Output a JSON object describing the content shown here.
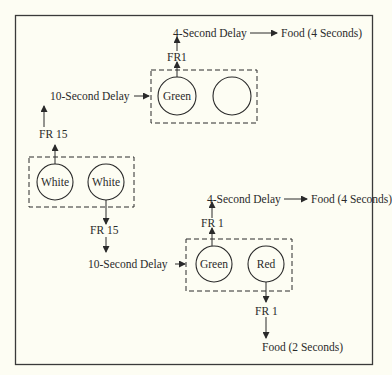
{
  "diagram": {
    "frame": {
      "x": 15,
      "y": 15,
      "width": 357,
      "height": 349
    },
    "colors": {
      "background": "#fdfdf3",
      "ink": "#2a2a2a"
    },
    "stages": [
      {
        "id": "initial-link",
        "keys": [
          {
            "label": "White"
          },
          {
            "label": "White"
          }
        ],
        "outputs": [
          {
            "schedule": "FR 15",
            "leads_to": "10-Second Delay",
            "then": "top-link"
          },
          {
            "schedule": "FR 15",
            "leads_to": "10-Second Delay",
            "then": "bottom-link"
          }
        ]
      },
      {
        "id": "top-link",
        "entry_label": "10-Second Delay",
        "keys": [
          {
            "label": "Green"
          },
          {
            "label": ""
          }
        ],
        "schedule": "FR1",
        "delay": "4-Second Delay",
        "outcome": "Food (4 Seconds)"
      },
      {
        "id": "bottom-link",
        "entry_label": "10-Second Delay",
        "keys": [
          {
            "label": "Green"
          },
          {
            "label": "Red"
          }
        ],
        "green_path": {
          "schedule": "FR 1",
          "delay": "4-Second Delay",
          "outcome": "Food (4 Seconds)"
        },
        "red_path": {
          "schedule": "FR 1",
          "outcome": "Food (2 Seconds)"
        }
      }
    ]
  }
}
